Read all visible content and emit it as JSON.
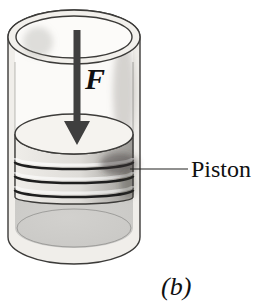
{
  "figure": {
    "labels": {
      "force": "F",
      "piston": "Piston",
      "subfigure": "(b)"
    },
    "colors": {
      "arrow": "#3f3f3f",
      "gas_fill": "#c7c6c3",
      "wall_fill": "#f0eeea",
      "rim_fill": "#f2f0ec",
      "opening_fill": "#fcfbf9",
      "interior_fill": "#fbfaf8",
      "piston_top_fill": "#f5f3ef",
      "piston_side_light": "#efede9",
      "piston_side_mid": "#dedcd8",
      "piston_side_dark": "#9b9995",
      "groove_dark": "#1e1e1e",
      "text": "#101010"
    }
  }
}
